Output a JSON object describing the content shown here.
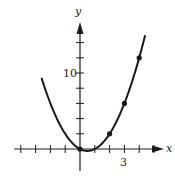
{
  "chart_data": {
    "type": "line",
    "title": "",
    "function": "y = x^2 - x",
    "xlabel": "x",
    "ylabel": "y",
    "x_tick_labels": [
      {
        "value": 3,
        "label": "3"
      }
    ],
    "y_tick_labels": [
      {
        "value": 10,
        "label": "10"
      }
    ],
    "x_ticks": [
      -4,
      -3,
      -2,
      -1,
      1,
      2,
      3,
      4,
      5
    ],
    "y_ticks": [
      2,
      4,
      6,
      8,
      10,
      12,
      14
    ],
    "xlim": [
      -4.5,
      5.5
    ],
    "ylim": [
      -2,
      16
    ],
    "grid": false,
    "series": [
      {
        "name": "curve",
        "x": [
          -2.6,
          -2,
          -1,
          0,
          0.5,
          1,
          2,
          3,
          4,
          4.4
        ],
        "y": [
          9.36,
          6,
          2,
          0,
          -0.25,
          0,
          2,
          6,
          12,
          14.96
        ]
      },
      {
        "name": "marked points",
        "x": [
          0,
          2,
          3,
          4
        ],
        "y": [
          0,
          2,
          6,
          12
        ]
      }
    ]
  },
  "labels": {
    "x_axis": "x",
    "y_axis": "y",
    "x_tick": "3",
    "y_tick": "10"
  }
}
